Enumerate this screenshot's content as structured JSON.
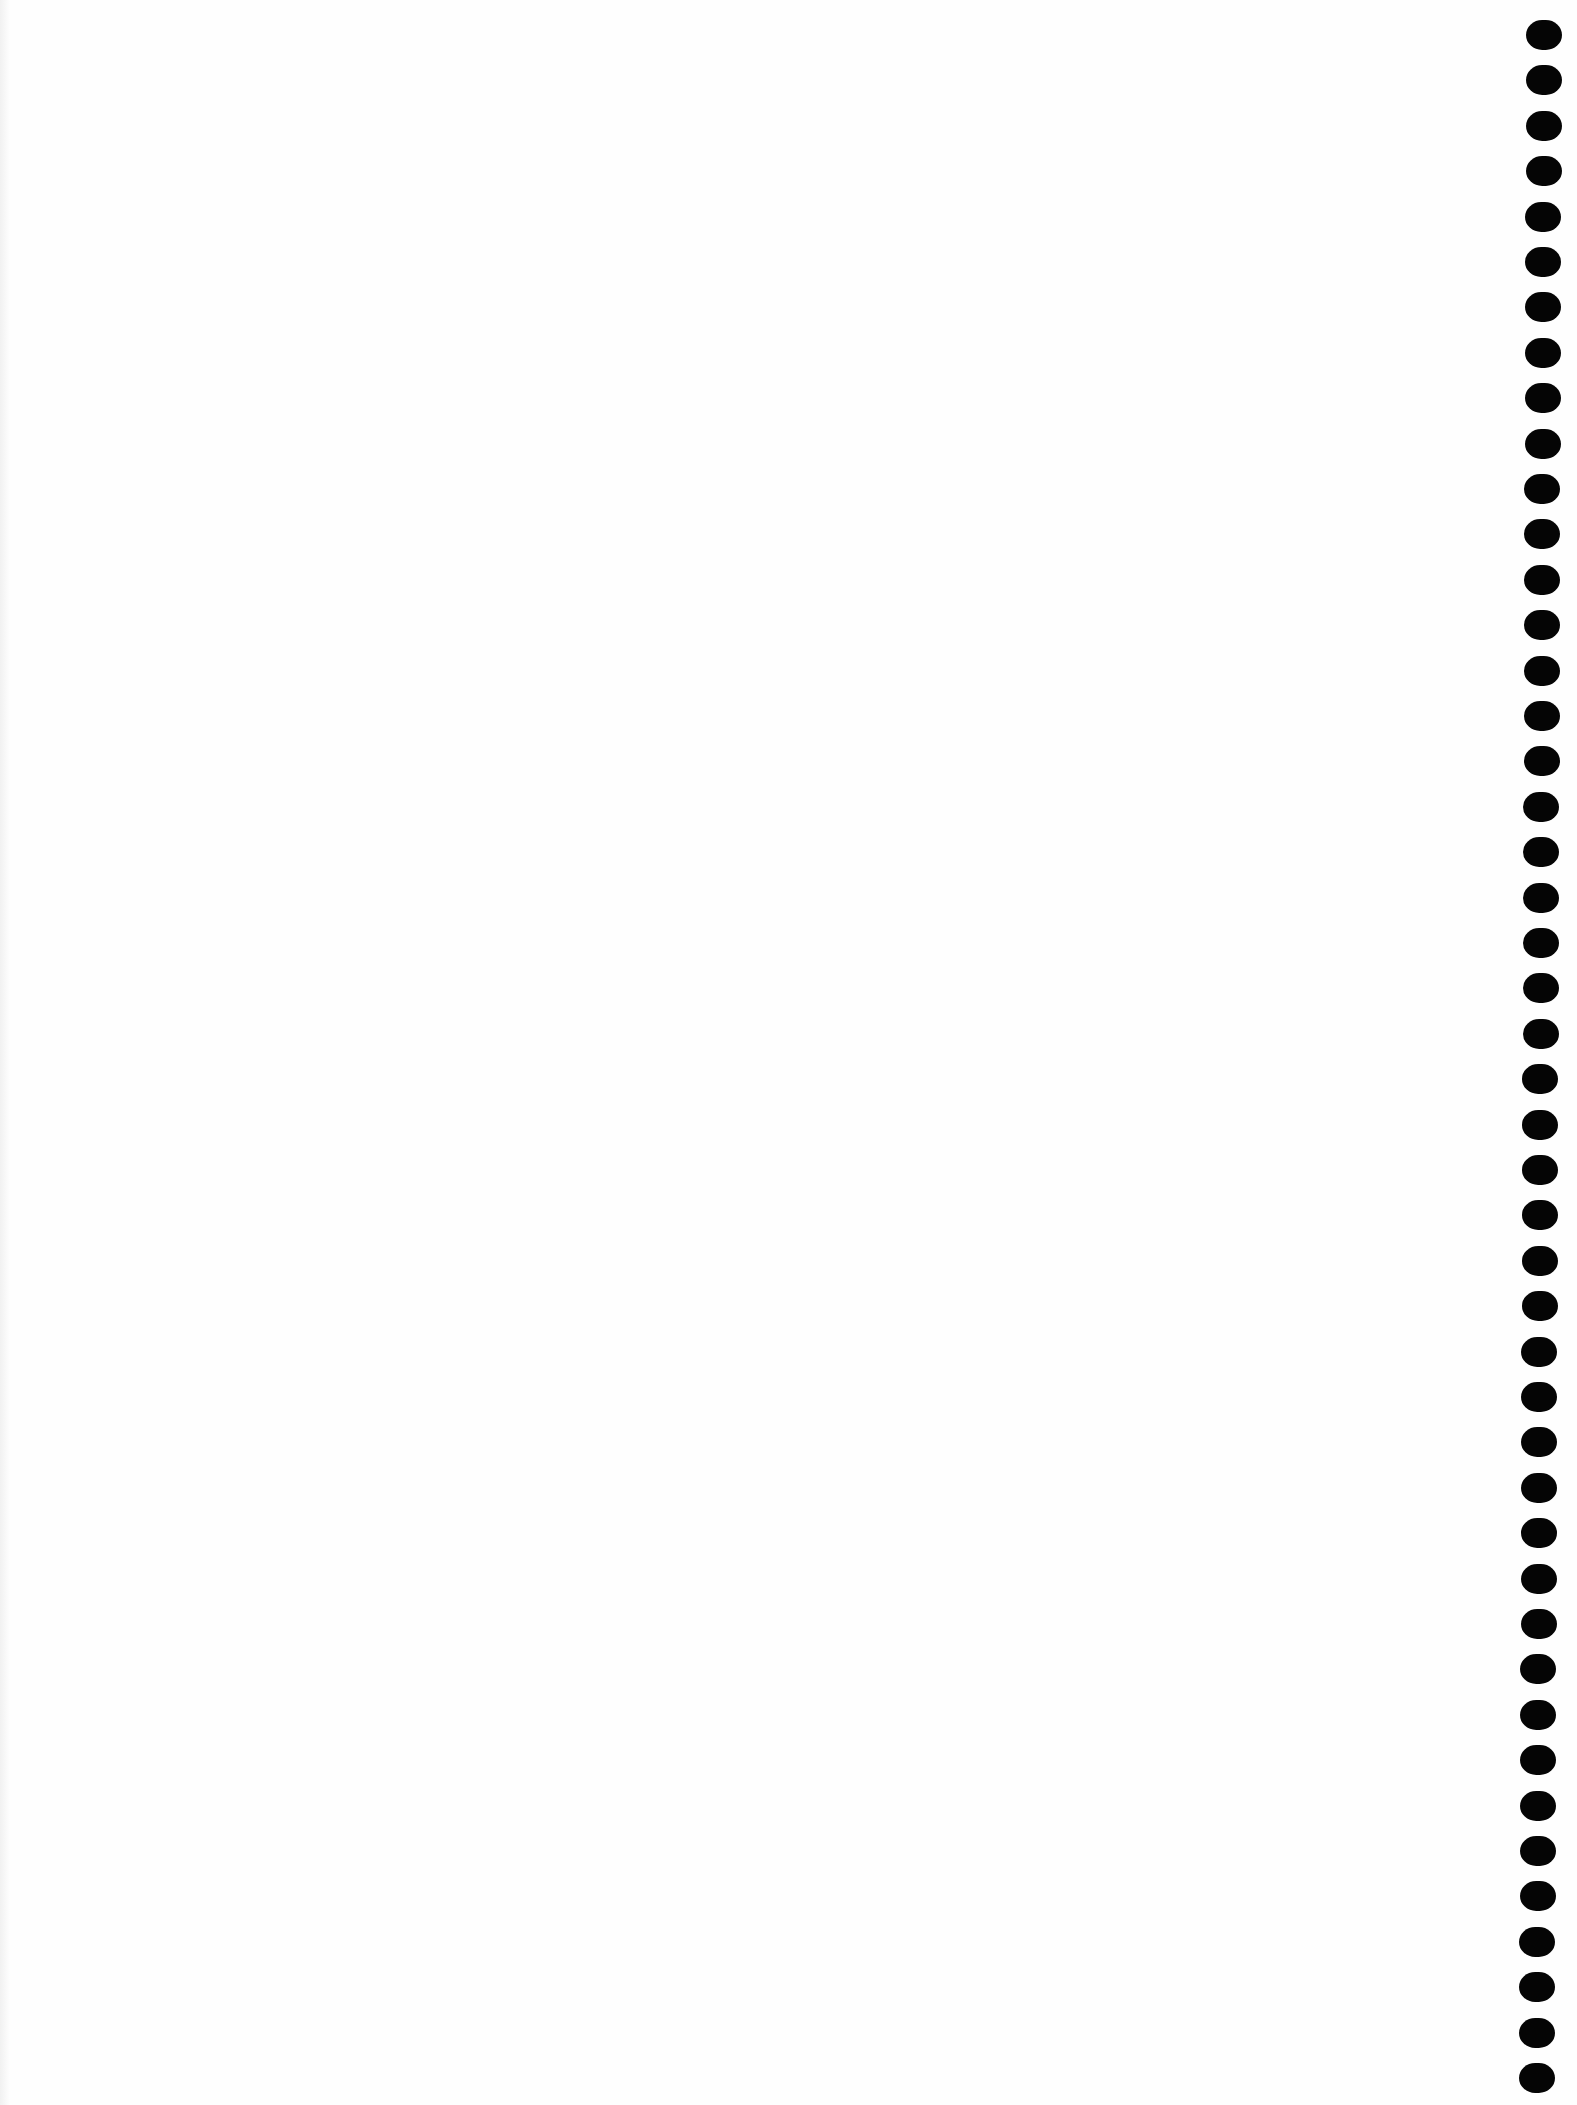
{
  "document": {
    "type": "blank spiral-bound notebook page",
    "background_color": "#fefefe",
    "text_content": ""
  },
  "binding": {
    "side": "right",
    "hole_icon": "binding-hole-icon",
    "hole_color": "#050505",
    "hole_count": 46,
    "hole_width": 36,
    "hole_height": 30,
    "first_hole_top": 20,
    "hole_pitch": 45.4,
    "column_x_top": 1526,
    "column_x_bottom": 1519
  }
}
